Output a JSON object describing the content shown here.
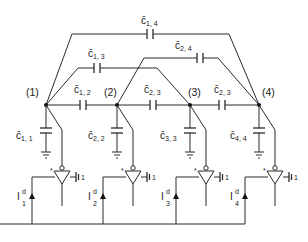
{
  "diagram": {
    "type": "capacitive-coupling-circuit",
    "nodes": [
      {
        "id": 1,
        "label": "(1)",
        "x": 46
      },
      {
        "id": 2,
        "label": "(2)",
        "x": 117
      },
      {
        "id": 3,
        "label": "(3)",
        "x": 190
      },
      {
        "id": 4,
        "label": "(4)",
        "x": 259
      }
    ],
    "coupling_capacitors": [
      {
        "label_main": "c̄",
        "label_sub": "1, 2",
        "between": [
          1,
          2
        ]
      },
      {
        "label_main": "c̄",
        "label_sub": "2, 3",
        "between": [
          2,
          3
        ]
      },
      {
        "label_main": "c̄",
        "label_sub": "2, 3",
        "between": [
          3,
          4
        ]
      },
      {
        "label_main": "c̄",
        "label_sub": "1, 3",
        "between": [
          1,
          3
        ]
      },
      {
        "label_main": "c̄",
        "label_sub": "2, 4",
        "between": [
          2,
          4
        ]
      },
      {
        "label_main": "c̄",
        "label_sub": "1, 4",
        "between": [
          1,
          4
        ]
      }
    ],
    "ground_capacitors": [
      {
        "label_main": "c̄",
        "label_sub": "1, 1",
        "node": 1
      },
      {
        "label_main": "c̄",
        "label_sub": "2, 2",
        "node": 2
      },
      {
        "label_main": "c̄",
        "label_sub": "3, 3",
        "node": 3
      },
      {
        "label_main": "c̄",
        "label_sub": "4, 4",
        "node": 4
      }
    ],
    "current_sources": [
      {
        "label_main": "I",
        "label_sub": "1",
        "label_sup": "d"
      },
      {
        "label_main": "I",
        "label_sub": "2",
        "label_sup": "d"
      },
      {
        "label_main": "I",
        "label_sub": "3",
        "label_sup": "d"
      },
      {
        "label_main": "I",
        "label_sub": "4",
        "label_sup": "d"
      }
    ],
    "amplifiers": [
      {
        "input_mark": "*",
        "side_label": "1"
      },
      {
        "input_mark": "*",
        "side_label": "1"
      },
      {
        "input_mark": "*",
        "side_label": "1"
      },
      {
        "input_mark": "*",
        "side_label": "1"
      }
    ]
  }
}
